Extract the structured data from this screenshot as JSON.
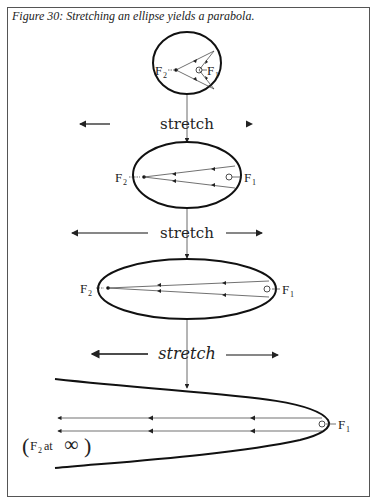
{
  "figure": {
    "caption": "Figure 30: Stretching an ellipse yields a parabola.",
    "stretch_label": "stretch",
    "focus_labels": {
      "f1": "F",
      "f1_sub": "1",
      "f2": "F",
      "f2_sub": "2"
    },
    "infinity_note": {
      "open": "(",
      "text_f": "F",
      "text_sub": "2",
      "text_at": " at ",
      "symbol": "∞",
      "close": ")"
    },
    "stages": [
      {
        "name": "circle-like ellipse",
        "shape": "ellipse",
        "cx": 187,
        "cy": 63,
        "rx": 34,
        "ry": 31
      },
      {
        "name": "moderate ellipse",
        "shape": "ellipse",
        "cx": 187,
        "cy": 175,
        "rx": 54,
        "ry": 33
      },
      {
        "name": "elongated ellipse",
        "shape": "ellipse",
        "cx": 187,
        "cy": 289,
        "rx": 89,
        "ry": 30
      },
      {
        "name": "parabola",
        "shape": "parabola",
        "vertex_x": 330,
        "vertex_y": 425
      }
    ],
    "colors": {
      "ink": "#222222",
      "border": "#555555",
      "background": "#ffffff"
    }
  }
}
